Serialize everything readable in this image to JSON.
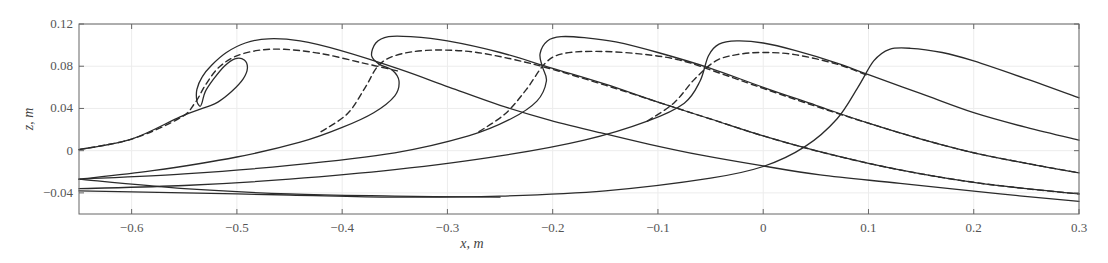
{
  "chart_data": {
    "type": "line",
    "title": "",
    "xlabel": "x, m",
    "ylabel": "z, m",
    "xlim": [
      -0.65,
      0.3
    ],
    "ylim": [
      -0.06,
      0.12
    ],
    "xticks": [
      -0.6,
      -0.5,
      -0.4,
      -0.3,
      -0.2,
      -0.1,
      0,
      0.1,
      0.2,
      0.3
    ],
    "xtick_labels": [
      "−0.6",
      "−0.5",
      "−0.4",
      "−0.3",
      "−0.2",
      "−0.1",
      "0",
      "0.1",
      "0.2",
      "0.3"
    ],
    "yticks": [
      -0.04,
      0,
      0.04,
      0.08,
      0.12
    ],
    "ytick_labels": [
      "−0.04",
      "0",
      "0.04",
      "0.08",
      "0.12"
    ],
    "grid": true,
    "legend": null,
    "series": [
      {
        "name": "wave-1 solid",
        "style": "solid",
        "points": [
          [
            -0.65,
            0.001
          ],
          [
            -0.6,
            0.011
          ],
          [
            -0.554,
            0.032
          ],
          [
            -0.53,
            0.041
          ],
          [
            -0.518,
            0.046
          ],
          [
            -0.505,
            0.056
          ],
          [
            -0.494,
            0.068
          ],
          [
            -0.49,
            0.078
          ],
          [
            -0.493,
            0.086
          ],
          [
            -0.502,
            0.087
          ],
          [
            -0.512,
            0.08
          ],
          [
            -0.522,
            0.068
          ],
          [
            -0.53,
            0.056
          ],
          [
            -0.533,
            0.046
          ],
          [
            -0.535,
            0.042
          ],
          [
            -0.538,
            0.047
          ],
          [
            -0.538,
            0.058
          ],
          [
            -0.533,
            0.07
          ],
          [
            -0.524,
            0.081
          ],
          [
            -0.51,
            0.093
          ],
          [
            -0.492,
            0.102
          ],
          [
            -0.47,
            0.106
          ],
          [
            -0.44,
            0.104
          ],
          [
            -0.402,
            0.095
          ],
          [
            -0.345,
            0.077
          ],
          [
            -0.298,
            0.06
          ],
          [
            -0.25,
            0.043
          ],
          [
            -0.203,
            0.029
          ],
          [
            -0.155,
            0.017
          ],
          [
            -0.108,
            0.006
          ],
          [
            -0.06,
            -0.004
          ],
          [
            -0.003,
            -0.014
          ],
          [
            0.054,
            -0.023
          ],
          [
            0.13,
            -0.031
          ],
          [
            0.225,
            -0.041
          ],
          [
            0.3,
            -0.048
          ]
        ]
      },
      {
        "name": "wave-1 dashed",
        "style": "dashed",
        "points": [
          [
            -0.65,
            0.001
          ],
          [
            -0.6,
            0.011
          ],
          [
            -0.554,
            0.031
          ],
          [
            -0.54,
            0.045
          ],
          [
            -0.53,
            0.062
          ],
          [
            -0.518,
            0.078
          ],
          [
            -0.502,
            0.089
          ],
          [
            -0.48,
            0.095
          ],
          [
            -0.455,
            0.096
          ],
          [
            -0.42,
            0.092
          ],
          [
            -0.38,
            0.083
          ],
          [
            -0.345,
            0.075
          ]
        ]
      },
      {
        "name": "wave-2 solid",
        "style": "solid",
        "points": [
          [
            -0.65,
            -0.027
          ],
          [
            -0.58,
            -0.019
          ],
          [
            -0.5,
            -0.006
          ],
          [
            -0.44,
            0.008
          ],
          [
            -0.4,
            0.022
          ],
          [
            -0.37,
            0.036
          ],
          [
            -0.35,
            0.052
          ],
          [
            -0.346,
            0.066
          ],
          [
            -0.352,
            0.076
          ],
          [
            -0.365,
            0.082
          ],
          [
            -0.372,
            0.09
          ],
          [
            -0.368,
            0.102
          ],
          [
            -0.356,
            0.108
          ],
          [
            -0.335,
            0.108
          ],
          [
            -0.3,
            0.104
          ],
          [
            -0.25,
            0.093
          ],
          [
            -0.2,
            0.078
          ],
          [
            -0.15,
            0.063
          ],
          [
            -0.1,
            0.046
          ],
          [
            -0.05,
            0.03
          ],
          [
            0.0,
            0.014
          ],
          [
            0.05,
            0.0
          ],
          [
            0.1,
            -0.012
          ],
          [
            0.15,
            -0.022
          ],
          [
            0.2,
            -0.03
          ],
          [
            0.25,
            -0.036
          ],
          [
            0.3,
            -0.041
          ]
        ]
      },
      {
        "name": "wave-2 dashed",
        "style": "dashed",
        "points": [
          [
            -0.42,
            0.018
          ],
          [
            -0.395,
            0.035
          ],
          [
            -0.378,
            0.06
          ],
          [
            -0.366,
            0.08
          ],
          [
            -0.35,
            0.09
          ],
          [
            -0.32,
            0.095
          ],
          [
            -0.28,
            0.094
          ],
          [
            -0.24,
            0.087
          ],
          [
            -0.2,
            0.077
          ],
          [
            -0.15,
            0.062
          ],
          [
            -0.1,
            0.046
          ],
          [
            -0.05,
            0.03
          ],
          [
            0.0,
            0.014
          ],
          [
            0.05,
            0.0
          ],
          [
            0.1,
            -0.012
          ],
          [
            0.15,
            -0.022
          ],
          [
            0.2,
            -0.03
          ],
          [
            0.25,
            -0.036
          ],
          [
            0.3,
            -0.041
          ]
        ]
      },
      {
        "name": "wave-3 solid",
        "style": "solid",
        "points": [
          [
            -0.65,
            -0.027
          ],
          [
            -0.55,
            -0.022
          ],
          [
            -0.45,
            -0.014
          ],
          [
            -0.35,
            -0.002
          ],
          [
            -0.28,
            0.014
          ],
          [
            -0.24,
            0.03
          ],
          [
            -0.215,
            0.047
          ],
          [
            -0.206,
            0.066
          ],
          [
            -0.21,
            0.08
          ],
          [
            -0.212,
            0.092
          ],
          [
            -0.205,
            0.104
          ],
          [
            -0.192,
            0.108
          ],
          [
            -0.17,
            0.107
          ],
          [
            -0.14,
            0.103
          ],
          [
            -0.1,
            0.093
          ],
          [
            -0.05,
            0.078
          ],
          [
            0.0,
            0.06
          ],
          [
            0.05,
            0.043
          ],
          [
            0.1,
            0.026
          ],
          [
            0.15,
            0.011
          ],
          [
            0.2,
            -0.002
          ],
          [
            0.25,
            -0.012
          ],
          [
            0.3,
            -0.021
          ]
        ]
      },
      {
        "name": "wave-3 dashed",
        "style": "dashed",
        "points": [
          [
            -0.27,
            0.018
          ],
          [
            -0.245,
            0.035
          ],
          [
            -0.225,
            0.058
          ],
          [
            -0.207,
            0.083
          ],
          [
            -0.19,
            0.092
          ],
          [
            -0.16,
            0.094
          ],
          [
            -0.12,
            0.092
          ],
          [
            -0.08,
            0.086
          ],
          [
            -0.04,
            0.073
          ],
          [
            0.0,
            0.059
          ],
          [
            0.05,
            0.042
          ],
          [
            0.1,
            0.026
          ],
          [
            0.15,
            0.011
          ],
          [
            0.2,
            -0.002
          ],
          [
            0.25,
            -0.012
          ],
          [
            0.3,
            -0.021
          ]
        ]
      },
      {
        "name": "wave-4 solid",
        "style": "solid",
        "points": [
          [
            -0.65,
            -0.036
          ],
          [
            -0.55,
            -0.033
          ],
          [
            -0.45,
            -0.027
          ],
          [
            -0.35,
            -0.018
          ],
          [
            -0.25,
            -0.005
          ],
          [
            -0.17,
            0.01
          ],
          [
            -0.11,
            0.028
          ],
          [
            -0.075,
            0.045
          ],
          [
            -0.06,
            0.066
          ],
          [
            -0.052,
            0.09
          ],
          [
            -0.042,
            0.101
          ],
          [
            -0.025,
            0.104
          ],
          [
            0.0,
            0.102
          ],
          [
            0.03,
            0.095
          ],
          [
            0.07,
            0.083
          ],
          [
            0.1,
            0.072
          ],
          [
            0.15,
            0.054
          ],
          [
            0.2,
            0.036
          ],
          [
            0.25,
            0.022
          ],
          [
            0.3,
            0.01
          ]
        ]
      },
      {
        "name": "wave-4 dashed",
        "style": "dashed",
        "points": [
          [
            -0.11,
            0.028
          ],
          [
            -0.085,
            0.045
          ],
          [
            -0.065,
            0.068
          ],
          [
            -0.045,
            0.085
          ],
          [
            -0.025,
            0.091
          ],
          [
            0.0,
            0.093
          ],
          [
            0.03,
            0.091
          ],
          [
            0.07,
            0.082
          ],
          [
            0.1,
            0.071
          ]
        ]
      },
      {
        "name": "wave-5 solid",
        "style": "solid",
        "points": [
          [
            -0.65,
            -0.038
          ],
          [
            -0.55,
            -0.04
          ],
          [
            -0.45,
            -0.042
          ],
          [
            -0.35,
            -0.044
          ],
          [
            -0.25,
            -0.043
          ],
          [
            -0.15,
            -0.038
          ],
          [
            -0.05,
            -0.026
          ],
          [
            0.0,
            -0.015
          ],
          [
            0.04,
            0.004
          ],
          [
            0.07,
            0.03
          ],
          [
            0.09,
            0.06
          ],
          [
            0.105,
            0.085
          ],
          [
            0.12,
            0.096
          ],
          [
            0.14,
            0.097
          ],
          [
            0.17,
            0.093
          ],
          [
            0.2,
            0.085
          ],
          [
            0.25,
            0.068
          ],
          [
            0.3,
            0.05
          ]
        ]
      },
      {
        "name": "wave-1 tail-from-left",
        "style": "solid",
        "points": [
          [
            -0.65,
            -0.027
          ],
          [
            -0.55,
            -0.036
          ],
          [
            -0.45,
            -0.041
          ],
          [
            -0.35,
            -0.043
          ],
          [
            -0.25,
            -0.044
          ]
        ]
      }
    ]
  }
}
